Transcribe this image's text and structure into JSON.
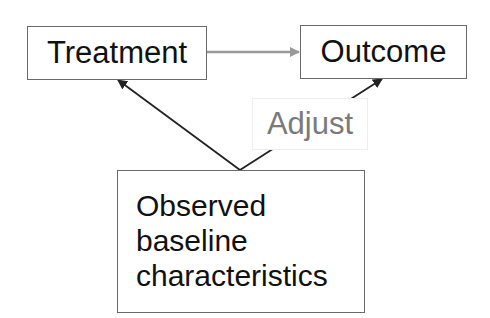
{
  "diagram": {
    "nodes": {
      "treatment": {
        "label": "Treatment"
      },
      "outcome": {
        "label": "Outcome"
      },
      "baseline": {
        "lines": [
          "Observed",
          "baseline",
          "characteristics"
        ]
      }
    },
    "edges": [
      {
        "from": "treatment",
        "to": "outcome",
        "color": "#999999"
      },
      {
        "from": "baseline",
        "to": "treatment",
        "color": "#222222"
      },
      {
        "from": "baseline",
        "to": "outcome",
        "color": "#222222",
        "label": "Adjust"
      }
    ],
    "edge_label": "Adjust",
    "colors": {
      "border": "#6a6a6a",
      "text": "#111111",
      "label_text": "#7a7a7a",
      "gray_arrow": "#999999"
    }
  }
}
